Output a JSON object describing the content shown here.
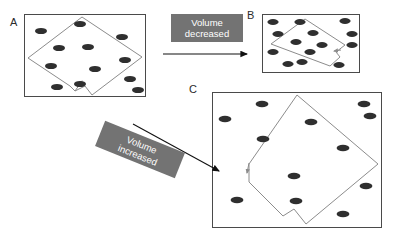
{
  "figure": {
    "type": "diagram",
    "background_color": "#ffffff",
    "particle_color": "#2f2f2f",
    "frame_color": "#4a4a4a",
    "piston_color": "#8c8c8c",
    "banner_color": "#737373",
    "banner_text_color": "#ffffff"
  },
  "panels": [
    {
      "id": "A",
      "label": "A",
      "label_x": 10,
      "label_y": 17,
      "frame": {
        "x": 24,
        "y": 14,
        "w": 122,
        "h": 83
      },
      "piston": {
        "shape": "diamond-with-notch",
        "points": "82,17 142,57 92,95 85,86 75,91 70,86 28,58",
        "notch_arrow": {
          "x1": 75,
          "y1": 91,
          "x2": 82,
          "y2": 81
        }
      },
      "particles": [
        {
          "x": 41,
          "y": 31
        },
        {
          "x": 80,
          "y": 24
        },
        {
          "x": 122,
          "y": 37
        },
        {
          "x": 59,
          "y": 48
        },
        {
          "x": 88,
          "y": 47
        },
        {
          "x": 125,
          "y": 60
        },
        {
          "x": 51,
          "y": 66
        },
        {
          "x": 95,
          "y": 69
        },
        {
          "x": 130,
          "y": 79
        },
        {
          "x": 57,
          "y": 87
        },
        {
          "x": 80,
          "y": 84
        },
        {
          "x": 138,
          "y": 90
        }
      ]
    },
    {
      "id": "B",
      "label": "B",
      "label_x": 247,
      "label_y": 10,
      "frame": {
        "x": 262,
        "y": 14,
        "w": 98,
        "h": 59
      },
      "piston": {
        "shape": "diamond-with-notch",
        "points": "305,19 345,45 336,52 340,57 330,66 271,44",
        "notch_arrow": {
          "x1": 340,
          "y1": 51,
          "x2": 334,
          "y2": 51
        }
      },
      "particles": [
        {
          "x": 273,
          "y": 22
        },
        {
          "x": 300,
          "y": 22
        },
        {
          "x": 345,
          "y": 21
        },
        {
          "x": 278,
          "y": 34
        },
        {
          "x": 313,
          "y": 33
        },
        {
          "x": 352,
          "y": 34
        },
        {
          "x": 296,
          "y": 42
        },
        {
          "x": 322,
          "y": 45
        },
        {
          "x": 352,
          "y": 45
        },
        {
          "x": 273,
          "y": 52
        },
        {
          "x": 310,
          "y": 52
        },
        {
          "x": 288,
          "y": 64
        },
        {
          "x": 302,
          "y": 62
        },
        {
          "x": 339,
          "y": 65
        }
      ]
    },
    {
      "id": "C",
      "label": "C",
      "label_x": 189,
      "label_y": 84,
      "frame": {
        "x": 212,
        "y": 92,
        "w": 170,
        "h": 136
      },
      "piston": {
        "shape": "diamond-with-notch",
        "points": "297,95 378,164 306,224 294,209 283,216 249,182 249,164",
        "notch_arrow": {
          "x1": 249,
          "y1": 164,
          "x2": 247,
          "y2": 173
        }
      },
      "particles": [
        {
          "x": 262,
          "y": 104
        },
        {
          "x": 364,
          "y": 104
        },
        {
          "x": 225,
          "y": 119
        },
        {
          "x": 311,
          "y": 122
        },
        {
          "x": 370,
          "y": 116
        },
        {
          "x": 263,
          "y": 139
        },
        {
          "x": 343,
          "y": 148
        },
        {
          "x": 294,
          "y": 176
        },
        {
          "x": 366,
          "y": 186
        },
        {
          "x": 237,
          "y": 200
        },
        {
          "x": 296,
          "y": 201
        },
        {
          "x": 343,
          "y": 214
        }
      ]
    }
  ],
  "transitions": [
    {
      "id": "volume-decreased",
      "label_line1": "Volume",
      "label_line2": "decreased",
      "direction": "horizontal-right",
      "arrow": {
        "x1": 163,
        "y1": 54,
        "x2": 249,
        "y2": 54
      }
    },
    {
      "id": "volume-increased",
      "label_line1": "Volume",
      "label_line2": "increased",
      "direction": "diagonal-down-right",
      "arrow": {
        "x1": 133,
        "y1": 124,
        "x2": 221,
        "y2": 172
      }
    }
  ]
}
